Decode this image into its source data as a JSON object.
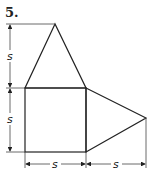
{
  "problem_number": "5.",
  "labels": {
    "left_top": "s",
    "left_bottom": "s",
    "bottom_left": "s",
    "bottom_right": "s"
  },
  "shapes": [
    "triangle-top",
    "square",
    "triangle-right"
  ],
  "colors": {
    "stroke": "#222222",
    "background": "#ffffff"
  }
}
